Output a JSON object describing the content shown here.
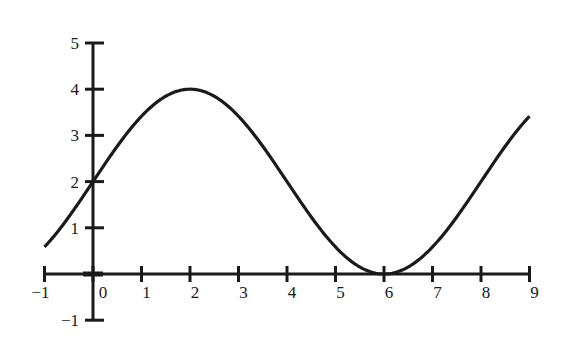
{
  "chart_data": {
    "type": "line",
    "title": "",
    "xlabel": "",
    "ylabel": "",
    "function": "y = 2 + 2 sin(pi x / 4)",
    "xlim": [
      -1,
      9
    ],
    "ylim": [
      -1,
      5
    ],
    "grid": false,
    "legend": null,
    "x_ticks": [
      -1,
      0,
      1,
      2,
      3,
      4,
      5,
      6,
      7,
      8,
      9
    ],
    "x_tick_labels": [
      "−1",
      "0",
      "1",
      "2",
      "3",
      "4",
      "5",
      "6",
      "7",
      "8",
      "9"
    ],
    "y_ticks": [
      -1,
      1,
      2,
      3,
      4,
      5
    ],
    "y_tick_labels": [
      "−1",
      "1",
      "2",
      "3",
      "4",
      "5"
    ],
    "series": [
      {
        "name": "curve",
        "color": "#1a1a1a",
        "x": [
          -1,
          -0.5,
          0,
          0.5,
          1,
          1.5,
          2,
          2.5,
          3,
          3.5,
          4,
          4.5,
          5,
          5.5,
          6,
          6.5,
          7,
          7.5,
          8,
          8.5,
          9
        ],
        "y": [
          0.59,
          1.23,
          2.0,
          2.77,
          3.41,
          3.85,
          4.0,
          3.85,
          3.41,
          2.77,
          2.0,
          1.23,
          0.59,
          0.15,
          0.0,
          0.15,
          0.59,
          1.23,
          2.0,
          2.77,
          3.41
        ]
      }
    ]
  }
}
